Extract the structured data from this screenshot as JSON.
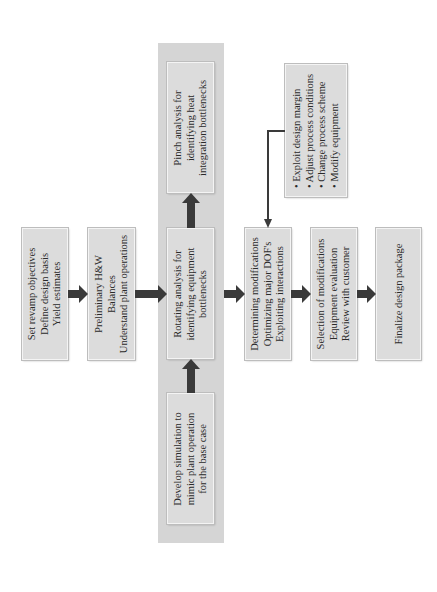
{
  "diagram": {
    "colors": {
      "box_fill": "#dcdcdc",
      "column_fill": "#d5d5d5",
      "arrow": "#3a3a3a",
      "text": "#2a2a2a"
    },
    "boxes": {
      "set_revamp": {
        "lines": [
          "Set revamp objectives",
          "Define design basis",
          "Yield estimates"
        ]
      },
      "preliminary": {
        "lines": [
          "Preliminary H&W",
          "Balances",
          "Understand plant operations"
        ]
      },
      "rotating": {
        "lines": [
          "Rotating analysis for",
          "identifying equipment",
          "bottlenecks"
        ]
      },
      "pinch": {
        "lines": [
          "Pinch analysis for",
          "identifying heat",
          "integration bottlenecks"
        ]
      },
      "develop_sim": {
        "lines": [
          "Develop simulation to",
          "mimic plant operation",
          "for the base case"
        ]
      },
      "determining": {
        "lines": [
          "Determining modifications",
          "Optimizing major DOF's",
          "Exploiting interactions"
        ]
      },
      "options": {
        "bullets": [
          "Exploit design margin",
          "Adjust process conditions",
          "Change process scheme",
          "Modify equipment"
        ]
      },
      "selection": {
        "lines": [
          "Selection of modifications",
          "Equipment evaluation",
          "Review with customer"
        ]
      },
      "finalize": {
        "lines": [
          "Finalize design package"
        ]
      }
    },
    "bullet_char": "•"
  }
}
